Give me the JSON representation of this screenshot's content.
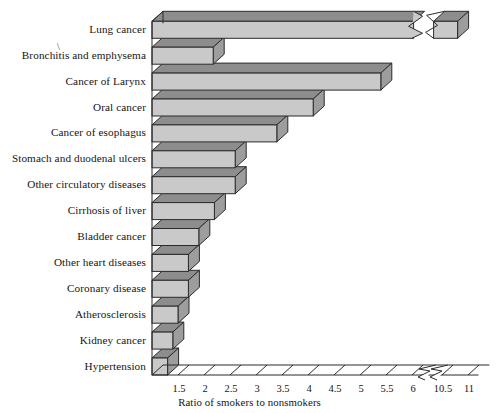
{
  "chart_data": {
    "type": "bar",
    "orientation": "horizontal",
    "title": "",
    "xlabel": "Ratio of smokers to nonsmokers",
    "ylabel": "",
    "categories": [
      "Lung cancer",
      "Bronchitis and emphysema",
      "Cancer of Larynx",
      "Oral cancer",
      "Cancer of esophagus",
      "Stomach and duodenal ulcers",
      "Other circulatory diseases",
      "Cirrhosis of liver",
      "Bladder cancer",
      "Other heart diseases",
      "Coronary disease",
      "Atherosclerosis",
      "Kidney cancer",
      "Hypertension"
    ],
    "values": [
      10.8,
      6.1,
      5.4,
      4.1,
      3.4,
      2.6,
      2.6,
      2.2,
      1.9,
      1.7,
      1.7,
      1.5,
      1.4,
      1.3
    ],
    "xticklabels": [
      "1.5",
      "2",
      "2.5",
      "3",
      "3.5",
      "4",
      "4.5",
      "5",
      "5.5",
      "6",
      "10.5",
      "11"
    ],
    "xtickvalues": [
      1.5,
      2,
      2.5,
      3,
      3.5,
      4,
      4.5,
      5,
      5.5,
      6,
      10.5,
      11
    ],
    "xlim": [
      1.0,
      11.2
    ],
    "axis_break": true,
    "axis_break_between": [
      6,
      10.5
    ],
    "bar_break_series": [
      "Lung cancer"
    ],
    "grid": false,
    "legend": null,
    "style_3d": true,
    "colors": {
      "bar_front": "#c9c9c9",
      "bar_top": "#8d8d8d",
      "bar_side": "#9d9d9d",
      "outline": "#2b2b2b",
      "axis": "#2b2b2b",
      "background": "#ffffff",
      "text": "#151515"
    }
  },
  "axis": {
    "title": "Ratio of smokers to nonsmokers"
  },
  "marks": {
    "stray_slash": "\\"
  }
}
